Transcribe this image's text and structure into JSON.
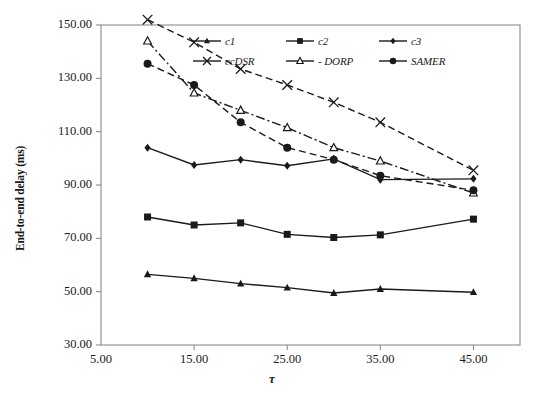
{
  "chart_data": {
    "type": "line",
    "title": "",
    "xlabel": "τ",
    "ylabel": "End-to-end delay (ms)",
    "x": [
      10,
      15,
      20,
      25,
      30,
      35,
      45
    ],
    "xlim": [
      5,
      50
    ],
    "ylim": [
      30,
      150
    ],
    "xticks": [
      "5.00",
      "15.00",
      "25.00",
      "35.00",
      "45.00"
    ],
    "xtick_values": [
      5,
      15,
      25,
      35,
      45
    ],
    "yticks": [
      "30.00",
      "50.00",
      "70.00",
      "90.00",
      "110.00",
      "130.00",
      "150.00"
    ],
    "ytick_values": [
      30,
      50,
      70,
      90,
      110,
      130,
      150
    ],
    "grid": false,
    "legend_position": "top-center-inside",
    "series": [
      {
        "name": "c1",
        "marker": "triangle",
        "line": "solid",
        "values": [
          56.5,
          55.0,
          53.0,
          51.5,
          49.5,
          51.0,
          49.8
        ]
      },
      {
        "name": "c2",
        "marker": "square",
        "line": "solid",
        "values": [
          78.0,
          75.0,
          75.8,
          71.5,
          70.3,
          71.3,
          77.2
        ]
      },
      {
        "name": "c3",
        "marker": "diamond",
        "line": "solid",
        "values": [
          104.0,
          97.5,
          99.5,
          97.2,
          99.8,
          92.0,
          92.3
        ]
      },
      {
        "name": "ccDSR",
        "marker": "cross",
        "line": "dashed",
        "values": [
          152.0,
          143.5,
          133.5,
          127.5,
          121.0,
          113.5,
          95.5
        ]
      },
      {
        "name": "DORP",
        "marker": "open-triangle",
        "line": "dash-dot",
        "values": [
          144.0,
          124.5,
          118.0,
          111.5,
          104.0,
          99.0,
          87.0
        ]
      },
      {
        "name": "SAMER",
        "marker": "circle",
        "line": "dashed",
        "values": [
          135.5,
          127.5,
          113.5,
          104.0,
          99.5,
          93.5,
          88.0
        ]
      }
    ]
  },
  "legend": {
    "rows": [
      [
        {
          "label": "c1",
          "marker": "triangle",
          "line": "solid"
        },
        {
          "label": "c2",
          "marker": "square",
          "line": "solid"
        },
        {
          "label": "c3",
          "marker": "diamond",
          "line": "solid"
        }
      ],
      [
        {
          "label": "ccDSR",
          "marker": "cross",
          "line": "solid"
        },
        {
          "label": "- DORP",
          "marker": "open-triangle",
          "line": "solid"
        },
        {
          "label": "SAMER",
          "marker": "circle",
          "line": "solid"
        }
      ]
    ]
  },
  "colors": {
    "line": "#1a1a1a",
    "axis": "#808080",
    "text": "#1a1a1a",
    "background": "#ffffff"
  }
}
